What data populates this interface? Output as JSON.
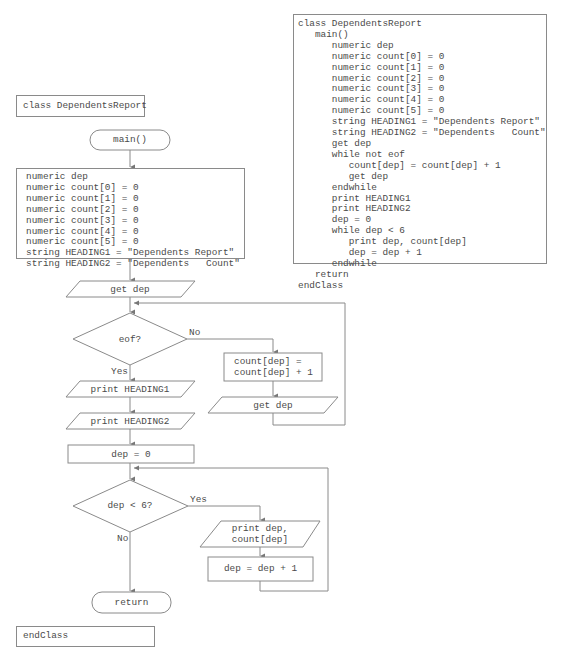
{
  "flowchart": {
    "class_label": "class DependentsReport",
    "main_terminal": "main()",
    "declarations": [
      "numeric dep",
      "numeric count[0] = 0",
      "numeric count[1] = 0",
      "numeric count[2] = 0",
      "numeric count[3] = 0",
      "numeric count[4] = 0",
      "numeric count[5] = 0",
      "string HEADING1 = \"Dependents Report\"",
      "string HEADING2 = \"Dependents   Count\""
    ],
    "input_get_dep": "get dep",
    "decision_eof": "eof?",
    "eof_no_label": "No",
    "eof_yes_label": "Yes",
    "process_count_line1": "count[dep] =",
    "process_count_line2": "count[dep] + 1",
    "input_get_dep_loop": "get dep",
    "output_heading1": "print HEADING1",
    "output_heading2": "print HEADING2",
    "process_dep_zero": "dep = 0",
    "decision_dep_lt_6": "dep < 6?",
    "dep_yes_label": "Yes",
    "dep_no_label": "No",
    "output_print_dep_line1": "print dep,",
    "output_print_dep_line2": "count[dep]",
    "process_dep_increment": "dep = dep + 1",
    "return_terminal": "return",
    "end_class_label": "endClass"
  },
  "pseudocode": {
    "lines": [
      "class DependentsReport",
      "   main()",
      "      numeric dep",
      "      numeric count[0] = 0",
      "      numeric count[1] = 0",
      "      numeric count[2] = 0",
      "      numeric count[3] = 0",
      "      numeric count[4] = 0",
      "      numeric count[5] = 0",
      "      string HEADING1 = \"Dependents Report\"",
      "      string HEADING2 = \"Dependents   Count\"",
      "      get dep",
      "      while not eof",
      "         count[dep] = count[dep] + 1",
      "         get dep",
      "      endwhile",
      "      print HEADING1",
      "      print HEADING2",
      "      dep = 0",
      "      while dep < 6",
      "         print dep, count[dep]",
      "         dep = dep + 1",
      "      endwhile",
      "   return",
      "endClass"
    ]
  },
  "colors": {
    "stroke": "#8a8a8a",
    "text": "#4a4a4a",
    "background": "#ffffff"
  }
}
